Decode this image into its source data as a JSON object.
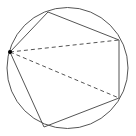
{
  "diagram": {
    "type": "pentagon inscribed in circle with diagonals from one vertex",
    "colors": {
      "stroke": "#555555",
      "vertex_point": "#000000",
      "background": "#ffffff"
    },
    "circle": {
      "cx": 67.5,
      "cy": 68,
      "r": 60.5
    },
    "vertices": [
      {
        "x": 10,
        "y": 52
      },
      {
        "x": 48,
        "y": 12
      },
      {
        "x": 119,
        "y": 40
      },
      {
        "x": 119,
        "y": 98
      },
      {
        "x": 44,
        "y": 127
      }
    ],
    "diagonals": [
      {
        "from": 0,
        "to": 2,
        "style": "dashed"
      },
      {
        "from": 0,
        "to": 3,
        "style": "dashed"
      }
    ],
    "highlighted_vertex": 0
  }
}
